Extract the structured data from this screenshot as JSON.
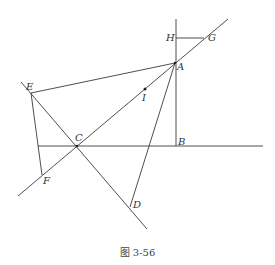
{
  "figure": {
    "caption": "图 3-56",
    "points": {
      "A": {
        "label": "A",
        "x": 175,
        "y": 63
      },
      "B": {
        "label": "B",
        "x": 176,
        "y": 146
      },
      "C": {
        "label": "C",
        "x": 77,
        "y": 146
      },
      "D": {
        "label": "D",
        "x": 130,
        "y": 207
      },
      "E": {
        "label": "E",
        "x": 31,
        "y": 93
      },
      "F": {
        "label": "F",
        "x": 42,
        "y": 175
      },
      "G": {
        "label": "G",
        "x": 204,
        "y": 38
      },
      "H": {
        "label": "H",
        "x": 176,
        "y": 38
      },
      "I": {
        "label": "I",
        "x": 145,
        "y": 89
      }
    },
    "colors": {
      "line": "#3a3a3a",
      "text": "#333333"
    }
  }
}
